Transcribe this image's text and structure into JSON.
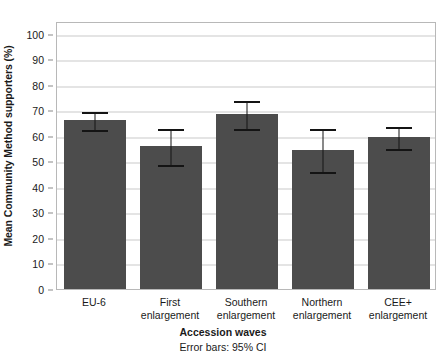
{
  "chart_data": {
    "type": "bar",
    "title": "",
    "xlabel": "Accession waves",
    "ylabel": "Mean Community Method supporters (%)",
    "caption": "Error bars: 95% CI",
    "categories": [
      "EU-6",
      "First enlargement",
      "Southern enlargement",
      "Northern enlargement",
      "CEE+ enlargement"
    ],
    "category_lines": [
      [
        "EU-6",
        ""
      ],
      [
        "First",
        "enlargement"
      ],
      [
        "Southern",
        "enlargement"
      ],
      [
        "Northern",
        "enlargement"
      ],
      [
        "CEE+",
        "enlargement"
      ]
    ],
    "values": [
      66.2,
      56.1,
      68.6,
      54.6,
      59.6
    ],
    "errors_low": [
      62.6,
      49.0,
      63.1,
      46.2,
      55.2
    ],
    "errors_high": [
      69.6,
      63.0,
      74.0,
      63.0,
      64.0
    ],
    "ylim": [
      0,
      105
    ],
    "yticks": [
      0,
      10,
      20,
      30,
      40,
      50,
      60,
      70,
      80,
      90,
      100
    ],
    "ytick_labels": [
      "0",
      "10",
      "20",
      "30",
      "40",
      "50",
      "60",
      "70",
      "80",
      "90",
      "100"
    ],
    "grid": true,
    "legend": "none",
    "bar_color": "#4c4c4c",
    "error_color": "#141414",
    "grid_color": "#c9c9c9",
    "axis_color": "#b8b8b8"
  }
}
